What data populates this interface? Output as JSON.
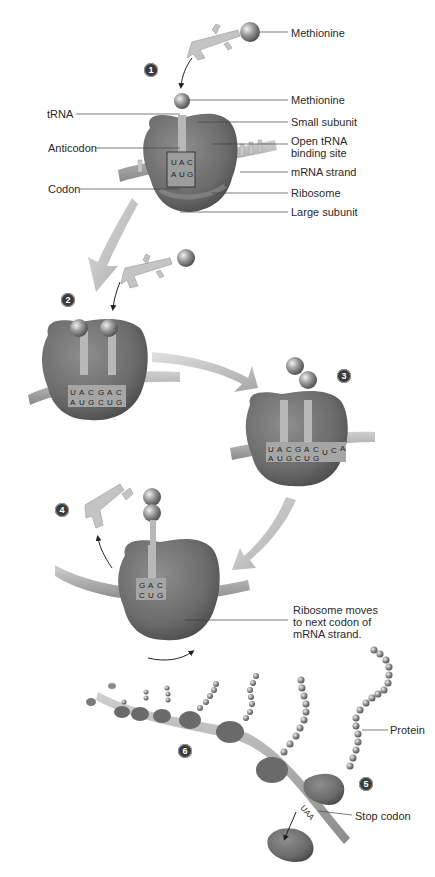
{
  "diagram": {
    "palette": {
      "ribosome_dark": "#5e5e5e",
      "ribosome_mid": "#7a7a7a",
      "ribosome_light": "#8d8d8d",
      "trna": "#bdbdbd",
      "mrna": "#a8a8a8",
      "arrow": "#b9b9b9",
      "badge": "#3a3a3a"
    },
    "steps": [
      {
        "number": "1",
        "label_id": "step-1"
      },
      {
        "number": "2",
        "label_id": "step-2"
      },
      {
        "number": "3",
        "label_id": "step-3"
      },
      {
        "number": "4",
        "label_id": "step-4"
      },
      {
        "number": "5",
        "label_id": "step-5"
      },
      {
        "number": "6",
        "label_id": "step-6"
      }
    ],
    "labels": {
      "methionine_free": "Methionine",
      "methionine_bound": "Methionine",
      "trna": "tRNA",
      "small_subunit": "Small subunit",
      "anticodon": "Anticodon",
      "open_trna_site": "Open tRNA binding site",
      "mrna_strand": "mRNA strand",
      "codon": "Codon",
      "ribosome": "Ribosome",
      "large_subunit": "Large subunit",
      "ribosome_moves": "Ribosome moves to next codon of mRNA strand.",
      "protein": "Protein",
      "stop_codon": "Stop codon"
    },
    "sequences": {
      "step1": {
        "anticodon": [
          "U",
          "A",
          "C"
        ],
        "codon": [
          "A",
          "U",
          "G"
        ]
      },
      "step2": {
        "anticodon": [
          "U",
          "A",
          "C",
          "G",
          "A",
          "C"
        ],
        "codon": [
          "A",
          "U",
          "G",
          "C",
          "U",
          "G"
        ]
      },
      "step3": {
        "anticodon": [
          "U",
          "A",
          "C",
          "G",
          "A",
          "C"
        ],
        "codon": [
          "A",
          "U",
          "G",
          "C",
          "U",
          "G"
        ],
        "next": [
          "U",
          "C",
          "A"
        ]
      },
      "step4": {
        "anticodon": [
          "G",
          "A",
          "C"
        ],
        "codon": [
          "C",
          "U",
          "G"
        ]
      },
      "stop": "UAA"
    }
  }
}
